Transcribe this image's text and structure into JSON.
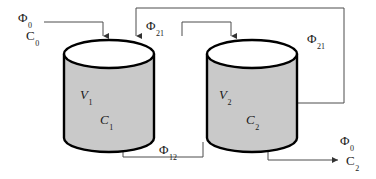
{
  "diagram": {
    "colors": {
      "tank_fill": "#c9c9c9",
      "tank_top_fill": "#ffffff",
      "tank_outline": "#000000",
      "pipe": "#4d4d4d",
      "background": "#ffffff",
      "text": "#1a1a1a"
    },
    "tanks": [
      {
        "id": "tank-1",
        "volume_symbol": "V",
        "volume_subscript": "1",
        "concentration_symbol": "C",
        "concentration_subscript": "1"
      },
      {
        "id": "tank-2",
        "volume_symbol": "V",
        "volume_subscript": "2",
        "concentration_symbol": "C",
        "concentration_subscript": "2"
      }
    ],
    "streams": [
      {
        "id": "feed",
        "flow_symbol": "Φ",
        "flow_subscript": "0",
        "conc_symbol": "C",
        "conc_subscript": "0",
        "description": "inlet feed to tank 1"
      },
      {
        "id": "recycle-21-top",
        "flow_symbol": "Φ",
        "flow_subscript": "21",
        "description": "recycle from tank 2 to tank 1"
      },
      {
        "id": "transfer-12",
        "flow_symbol": "Φ",
        "flow_subscript": "12",
        "description": "flow from tank 1 to tank 2"
      },
      {
        "id": "recycle-21-right",
        "flow_symbol": "Φ",
        "flow_subscript": "21",
        "description": "return line leaving tank 2 right side"
      },
      {
        "id": "outlet",
        "flow_symbol": "Φ",
        "flow_subscript": "0",
        "conc_symbol": "C",
        "conc_subscript": "2",
        "description": "outlet from tank 2"
      }
    ]
  }
}
